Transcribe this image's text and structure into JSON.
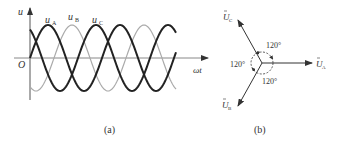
{
  "figure_a": {
    "caption": "(a)",
    "y_axis_label": "u",
    "x_axis_label": "ωt",
    "origin_label": "O",
    "waves": [
      {
        "name": "u",
        "sub": "A",
        "phase_deg": 0,
        "stroke": "#222222",
        "width": 2.0
      },
      {
        "name": "u",
        "sub": "B",
        "phase_deg": -120,
        "stroke": "#aaaaaa",
        "width": 1.2
      },
      {
        "name": "u",
        "sub": "C",
        "phase_deg": 120,
        "stroke": "#222222",
        "width": 2.0
      }
    ]
  },
  "figure_b": {
    "caption": "(b)",
    "phasors": [
      {
        "name": "U",
        "sub": "A",
        "angle_deg": 0
      },
      {
        "name": "U",
        "sub": "B",
        "angle_deg": -120
      },
      {
        "name": "U",
        "sub": "C",
        "angle_deg": 120
      }
    ],
    "angle_labels": [
      "120°",
      "120°",
      "120°"
    ]
  }
}
